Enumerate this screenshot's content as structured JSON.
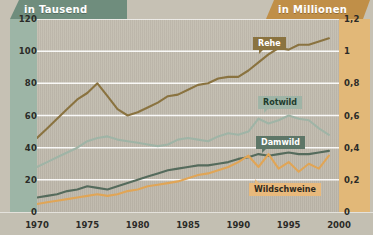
{
  "header": {
    "left_label": "in Tausend",
    "right_label": "in Millionen",
    "left_color": "#6f8d7d",
    "right_color": "#c08f48"
  },
  "axes": {
    "left_ticks": [
      "120",
      "100",
      "80",
      "60",
      "40",
      "20",
      "0"
    ],
    "right_ticks": [
      "1,2",
      "1",
      "0,8",
      "0,6",
      "0,4",
      "0,2",
      "0"
    ],
    "x_ticks": [
      "1970",
      "1975",
      "1980",
      "1985",
      "1990",
      "1995",
      "2000"
    ]
  },
  "callouts": {
    "rehe": "Rehe",
    "rotwild": "Rotwild",
    "damwild": "Damwild",
    "wildschweine": "Wildschweine"
  },
  "chart_data": {
    "type": "line",
    "title": "",
    "subtitle": "",
    "xlabel": "",
    "ylabel": "in Tausend",
    "ylabel_secondary": "in Millionen",
    "xlim": [
      1970,
      2000
    ],
    "ylim": [
      0,
      120
    ],
    "ylim_secondary": [
      0,
      1.2
    ],
    "grid": true,
    "gridlines_y": [
      0,
      20,
      40,
      60,
      80,
      100,
      120
    ],
    "legend": "inline-callouts",
    "x": [
      1970,
      1971,
      1972,
      1973,
      1974,
      1975,
      1976,
      1977,
      1978,
      1979,
      1980,
      1981,
      1982,
      1983,
      1984,
      1985,
      1986,
      1987,
      1988,
      1989,
      1990,
      1991,
      1992,
      1993,
      1994,
      1995,
      1996,
      1997,
      1998,
      1999
    ],
    "series": [
      {
        "name": "Rehe",
        "axis": "left",
        "unit": "Tausend",
        "color": "#8a7340",
        "values": [
          46,
          52,
          58,
          64,
          70,
          74,
          80,
          72,
          64,
          60,
          62,
          65,
          68,
          72,
          73,
          76,
          79,
          80,
          83,
          84,
          84,
          88,
          93,
          98,
          102,
          101,
          104,
          104,
          106,
          108
        ]
      },
      {
        "name": "Rotwild",
        "axis": "left",
        "unit": "Tausend",
        "color": "#9fb4a6",
        "values": [
          28,
          31,
          34,
          37,
          40,
          44,
          46,
          47,
          45,
          44,
          43,
          42,
          41,
          42,
          45,
          46,
          45,
          44,
          47,
          49,
          48,
          50,
          58,
          55,
          57,
          60,
          58,
          57,
          52,
          48
        ]
      },
      {
        "name": "Damwild",
        "axis": "left",
        "unit": "Tausend",
        "color": "#556b5c",
        "values": [
          9,
          10,
          11,
          13,
          14,
          16,
          15,
          14,
          16,
          18,
          20,
          22,
          24,
          26,
          27,
          28,
          29,
          29,
          30,
          31,
          33,
          34,
          36,
          35,
          36,
          37,
          36,
          36,
          37,
          38
        ]
      },
      {
        "name": "Wildschweine",
        "axis": "right",
        "unit": "Millionen",
        "color": "#e0a556",
        "values": [
          0.05,
          0.06,
          0.07,
          0.08,
          0.09,
          0.1,
          0.11,
          0.1,
          0.11,
          0.13,
          0.14,
          0.16,
          0.17,
          0.18,
          0.19,
          0.21,
          0.23,
          0.24,
          0.26,
          0.28,
          0.31,
          0.35,
          0.28,
          0.36,
          0.27,
          0.31,
          0.25,
          0.3,
          0.27,
          0.35
        ]
      }
    ]
  }
}
